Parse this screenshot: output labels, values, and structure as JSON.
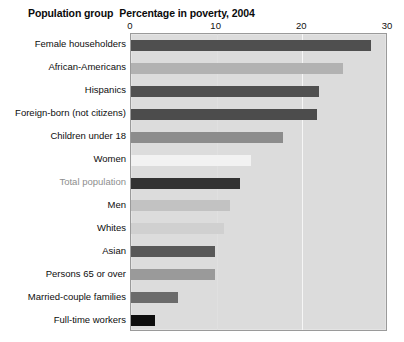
{
  "header": {
    "group_label": "Population group",
    "title": "Percentage in poverty, 2004"
  },
  "chart_data": {
    "type": "bar",
    "orientation": "horizontal",
    "title": "Percentage in poverty, 2004",
    "xlabel": "",
    "ylabel": "Population group",
    "xlim": [
      0,
      30
    ],
    "xticks": [
      0,
      10,
      20,
      30
    ],
    "xtick_labels": [
      "0",
      "10",
      "20",
      "30"
    ],
    "grid": true,
    "gridlines_at": [
      10,
      20
    ],
    "legend": "none",
    "plot_background": "#dcdcdc",
    "categories": [
      "Female householders",
      "African-Americans",
      "Hispanics",
      "Foreign-born (not citizens)",
      "Children under 18",
      "Women",
      "Total population",
      "Men",
      "Whites",
      "Asian",
      "Persons 65 or over",
      "Married-couple families",
      "Full-time workers"
    ],
    "values": [
      28.0,
      24.7,
      21.9,
      21.7,
      17.8,
      14.0,
      12.7,
      11.5,
      10.8,
      9.8,
      9.8,
      5.5,
      2.8
    ],
    "bar_colors": [
      "#4f4f4f",
      "#b2b2b2",
      "#505050",
      "#4c4c4c",
      "#8c8c8c",
      "#f2f2f2",
      "#333333",
      "#c2c2c2",
      "#d0d0d0",
      "#585858",
      "#9a9a9a",
      "#6b6b6b",
      "#0d0d0d"
    ],
    "highlighted_category": "Total population",
    "highlight_label_color": "#8e8e8e"
  }
}
